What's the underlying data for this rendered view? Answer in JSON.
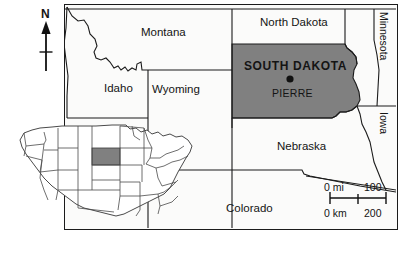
{
  "figure": {
    "kind": "reference-map",
    "subject": "South Dakota",
    "frame": {
      "x": 64,
      "y": 4,
      "width": 334,
      "height": 226
    }
  },
  "map": {
    "highlight_fill": "#808080",
    "background_fill": "#fbfbfa",
    "line_color": "#1b1b1b",
    "labels": [
      {
        "name": "montana",
        "text": "Montana",
        "x": 141,
        "y": 27,
        "style": "state"
      },
      {
        "name": "north-dakota",
        "text": "North Dakota",
        "x": 260,
        "y": 17,
        "style": "state"
      },
      {
        "name": "idaho",
        "text": "Idaho",
        "x": 104,
        "y": 83,
        "style": "state"
      },
      {
        "name": "wyoming",
        "text": "Wyoming",
        "x": 152,
        "y": 84,
        "style": "state"
      },
      {
        "name": "south-dakota",
        "text": "SOUTH  DAKOTA",
        "x": 259,
        "y": 60,
        "style": "highlight"
      },
      {
        "name": "nebraska",
        "text": "Nebraska",
        "x": 277,
        "y": 141,
        "style": "state"
      },
      {
        "name": "colorado",
        "text": "Colorado",
        "x": 226,
        "y": 203,
        "style": "state"
      }
    ],
    "rotated_labels": [
      {
        "name": "minnesota",
        "text": "Minnesota",
        "x": 380,
        "y": 12,
        "style": "rotated"
      },
      {
        "name": "iowa",
        "text": "Iowa",
        "x": 380,
        "y": 105,
        "style": "rotated"
      }
    ],
    "capital": {
      "name": "pierre",
      "text": "PIERRE",
      "marker_x": 290,
      "marker_y": 79,
      "label_x": 272,
      "label_y": 87
    }
  },
  "north_arrow": {
    "label": "N",
    "label_x": 41,
    "label_y": 8,
    "shaft_x": 46,
    "shaft_top": 24,
    "shaft_bottom": 71,
    "cross_y": 52
  },
  "scale_bar": {
    "miles": {
      "zero": "0 mi",
      "max": "100"
    },
    "kilometers": {
      "zero": "0 km",
      "max": "200"
    },
    "bar_left": 330,
    "bar_right": 386,
    "bar_y": 203,
    "top_label_y": 188,
    "bottom_label_y": 212
  },
  "inset": {
    "name": "united-states-locator",
    "x": 14,
    "y": 120,
    "width": 182,
    "height": 106,
    "highlighted_state": "South Dakota",
    "highlight_fill": "#808080"
  }
}
